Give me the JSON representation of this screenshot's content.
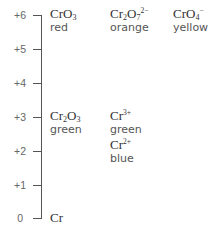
{
  "axis": {
    "ticks": [
      {
        "label": "+6",
        "value": 6
      },
      {
        "label": "+5",
        "value": 5
      },
      {
        "label": "+4",
        "value": 4
      },
      {
        "label": "+3",
        "value": 3
      },
      {
        "label": "+2",
        "value": 2
      },
      {
        "label": "+1",
        "value": 1
      },
      {
        "label": "0",
        "value": 0
      }
    ]
  },
  "species": [
    {
      "oxidation_state": 6,
      "formula_base": "CrO",
      "sub": "3",
      "sup": "",
      "color_name": "red"
    },
    {
      "oxidation_state": 6,
      "formula_base": "Cr",
      "sub1": "2",
      "mid": "O",
      "sub": "7",
      "sup": "2−",
      "color_name": "orange"
    },
    {
      "oxidation_state": 6,
      "formula_base": "CrO",
      "sub": "4",
      "sup": "−",
      "color_name": "yellow"
    },
    {
      "oxidation_state": 3,
      "formula_base": "Cr",
      "sub1": "2",
      "mid": "O",
      "sub": "3",
      "sup": "",
      "color_name": "green"
    },
    {
      "oxidation_state": 3,
      "formula_base": "Cr",
      "sub": "",
      "sup": "3+",
      "color_name": "green"
    },
    {
      "oxidation_state": 2,
      "formula_base": "Cr",
      "sub": "",
      "sup": "2+",
      "color_name": "blue"
    },
    {
      "oxidation_state": 0,
      "formula_base": "Cr",
      "sub": "",
      "sup": "",
      "color_name": ""
    }
  ]
}
